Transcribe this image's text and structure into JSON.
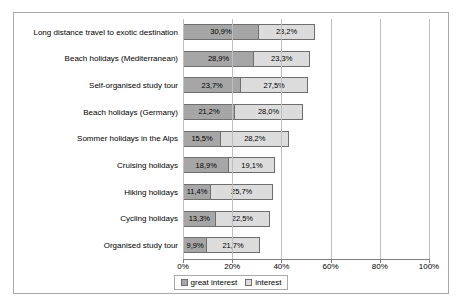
{
  "chart_data": {
    "type": "bar",
    "orientation": "horizontal",
    "stacked": true,
    "title": "",
    "xlabel": "",
    "ylabel": "",
    "xlim": [
      0,
      100
    ],
    "xticks": [
      "0%",
      "20%",
      "40%",
      "60%",
      "80%",
      "100%"
    ],
    "xtick_values": [
      0,
      20,
      40,
      60,
      80,
      100
    ],
    "grid": true,
    "legend_position": "bottom",
    "categories": [
      "Long distance travel to exotic destination",
      "Beach holidays (Mediterranean)",
      "Self-organised study tour",
      "Beach holidays (Germany)",
      "Sommer holidays in the Alps",
      "Cruising holidays",
      "Hiking holidays",
      "Cycling holidays",
      "Organised study tour"
    ],
    "series": [
      {
        "name": "great interest",
        "color": "#a6a6a6",
        "values": [
          30.9,
          28.9,
          23.7,
          21.2,
          15.5,
          18.9,
          11.4,
          13.3,
          9.9
        ],
        "labels": [
          "30,9%",
          "28,9%",
          "23,7%",
          "21,2%",
          "15,5%",
          "18,9%",
          "11,4%",
          "13,3%",
          "9,9%"
        ]
      },
      {
        "name": "interest",
        "color": "#dcdcdc",
        "values": [
          23.2,
          23.3,
          27.5,
          28.0,
          28.2,
          19.1,
          25.7,
          22.5,
          21.7
        ],
        "labels": [
          "23,2%",
          "23,3%",
          "27,5%",
          "28,0%",
          "28,2%",
          "19,1%",
          "25,7%",
          "22,5%",
          "21,7%"
        ]
      }
    ]
  }
}
